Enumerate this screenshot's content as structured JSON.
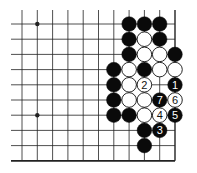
{
  "diagram": {
    "grid": {
      "cols": 11,
      "rows": 10,
      "x0": 22,
      "y0": 24,
      "dx": 15.3,
      "dy": 15.2,
      "extend_left_to": 11,
      "extend_top_to": 10,
      "right_edge": true,
      "bottom_edge": true
    },
    "star_points": [
      {
        "col": 1,
        "row": 0
      },
      {
        "col": 1,
        "row": 6
      }
    ],
    "stones": [
      {
        "col": 7,
        "row": 0,
        "color": "black"
      },
      {
        "col": 8,
        "row": 0,
        "color": "black"
      },
      {
        "col": 9,
        "row": 0,
        "color": "black"
      },
      {
        "col": 7,
        "row": 1,
        "color": "black"
      },
      {
        "col": 8,
        "row": 1,
        "color": "white"
      },
      {
        "col": 9,
        "row": 1,
        "color": "black"
      },
      {
        "col": 7,
        "row": 2,
        "color": "black"
      },
      {
        "col": 8,
        "row": 2,
        "color": "white"
      },
      {
        "col": 9,
        "row": 2,
        "color": "white"
      },
      {
        "col": 10,
        "row": 2,
        "color": "black"
      },
      {
        "col": 6,
        "row": 3,
        "color": "black"
      },
      {
        "col": 7,
        "row": 3,
        "color": "white"
      },
      {
        "col": 8,
        "row": 3,
        "color": "black"
      },
      {
        "col": 9,
        "row": 3,
        "color": "white"
      },
      {
        "col": 10,
        "row": 3,
        "color": "white"
      },
      {
        "col": 6,
        "row": 4,
        "color": "black"
      },
      {
        "col": 7,
        "row": 4,
        "color": "white"
      },
      {
        "col": 8,
        "row": 4,
        "color": "white",
        "label": "2"
      },
      {
        "col": 10,
        "row": 4,
        "color": "black",
        "label": "1"
      },
      {
        "col": 6,
        "row": 5,
        "color": "black"
      },
      {
        "col": 7,
        "row": 5,
        "color": "white"
      },
      {
        "col": 8,
        "row": 5,
        "color": "white"
      },
      {
        "col": 9,
        "row": 5,
        "color": "black",
        "label": "7"
      },
      {
        "col": 10,
        "row": 5,
        "color": "white",
        "label": "6"
      },
      {
        "col": 6,
        "row": 6,
        "color": "black"
      },
      {
        "col": 7,
        "row": 6,
        "color": "black"
      },
      {
        "col": 8,
        "row": 6,
        "color": "white"
      },
      {
        "col": 9,
        "row": 6,
        "color": "white",
        "label": "4"
      },
      {
        "col": 10,
        "row": 6,
        "color": "black",
        "label": "5"
      },
      {
        "col": 8,
        "row": 7,
        "color": "black"
      },
      {
        "col": 9,
        "row": 7,
        "color": "black",
        "label": "3"
      },
      {
        "col": 8,
        "row": 8,
        "color": "black"
      }
    ],
    "colors": {
      "line": "#222222",
      "black_stone": "#0a0a0a",
      "white_stone": "#ffffff",
      "background": "#ffffff"
    }
  }
}
